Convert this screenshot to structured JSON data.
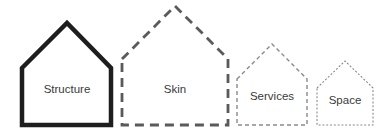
{
  "diagram": {
    "layers": [
      {
        "label": "Structure",
        "stroke": "#1e1e1e",
        "style": "solid"
      },
      {
        "label": "Skin",
        "stroke": "#5a5a5a",
        "style": "long-dash"
      },
      {
        "label": "Services",
        "stroke": "#8a8a8a",
        "style": "dash"
      },
      {
        "label": "Space",
        "stroke": "#8a8a8a",
        "style": "dotted"
      }
    ]
  }
}
